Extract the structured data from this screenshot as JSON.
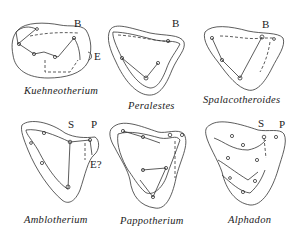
{
  "figure": {
    "panels": [
      {
        "id": "kuehneotherium",
        "name": "Kuehneotherium",
        "labels": [
          "B",
          "E"
        ]
      },
      {
        "id": "peralestes",
        "name": "Peralestes",
        "labels": [
          "B"
        ]
      },
      {
        "id": "spalacotheroides",
        "name": "Spalacotheroides",
        "labels": [
          "B"
        ]
      },
      {
        "id": "amblotherium",
        "name": "Amblotherium",
        "labels": [
          "S",
          "P",
          "E?"
        ]
      },
      {
        "id": "pappotherium",
        "name": "Pappotherium",
        "labels": []
      },
      {
        "id": "alphadon",
        "name": "Alphadon",
        "labels": [
          "S",
          "P"
        ]
      }
    ]
  }
}
